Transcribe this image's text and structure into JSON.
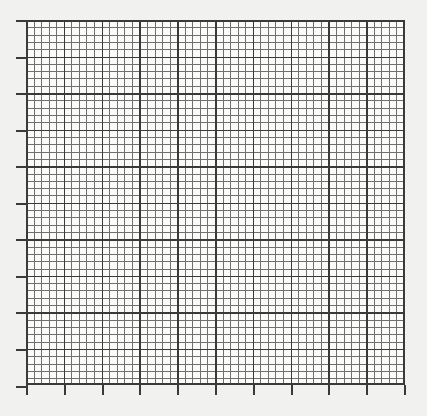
{
  "figure": {
    "type": "graph-paper-grid",
    "width": 427,
    "height": 416,
    "background_color": "#f1f1f0",
    "title": "",
    "subtitle": "",
    "caption": ""
  },
  "chart_data": {
    "type": "table",
    "title": "",
    "subtitle": "",
    "xlabel": "",
    "ylabel": "",
    "grid": "on",
    "legend": "none",
    "legend_position": "none",
    "annotations": [],
    "categories": [],
    "values": [],
    "series": [],
    "plot_area": {
      "left": 26,
      "top": 20,
      "right": 405,
      "bottom": 385,
      "width": 379,
      "height": 365
    },
    "minor_grid": {
      "spacing_x": 7.56,
      "spacing_y": 7.31,
      "line_width": 1,
      "color": "#6f6f6f",
      "count_x": 50,
      "count_y": 50
    },
    "major_grid": {
      "spacing_x": 37.8,
      "spacing_y": 36.55,
      "minor_per_major": 5,
      "line_width": 1.5,
      "color": "#3a3a3a",
      "count_x": 10,
      "count_y": 10
    },
    "frame": {
      "color": "#3a3a3a",
      "line_width": 2
    },
    "cell_color": "#fbfbfa",
    "xlim": [
      0,
      10
    ],
    "ylim": [
      0,
      10
    ],
    "xticks": [
      0,
      1,
      2,
      3,
      4,
      5,
      6,
      7,
      8,
      9,
      10
    ],
    "yticks": [
      0,
      1,
      2,
      3,
      4,
      5,
      6,
      7,
      8,
      9,
      10
    ],
    "xticklabels": [
      "",
      "",
      "",
      "",
      "",
      "",
      "",
      "",
      "",
      "",
      ""
    ],
    "yticklabels": [
      "",
      "",
      "",
      "",
      "",
      "",
      "",
      "",
      "",
      "",
      ""
    ],
    "tick_marks": {
      "left": {
        "visible": true,
        "length": 10,
        "width": 2,
        "color": "#3a3a3a",
        "count": 11
      },
      "bottom": {
        "visible": true,
        "length": 10,
        "width": 2,
        "color": "#3a3a3a",
        "count": 11
      },
      "top": {
        "visible": false,
        "count": 0
      },
      "right": {
        "visible": false,
        "count": 0
      }
    }
  }
}
